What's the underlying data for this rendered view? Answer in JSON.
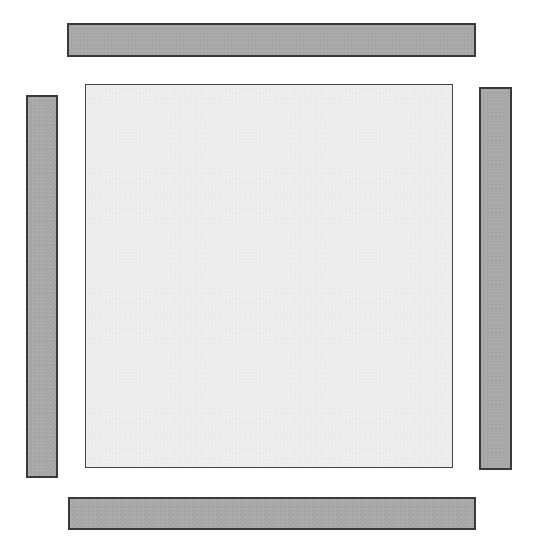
{
  "diagram": {
    "type": "layout",
    "colors": {
      "background": "#ffffff",
      "center_fill": "#ececec",
      "bar_fill": "#a9a9a9",
      "border": "#3a3a3a"
    },
    "elements": [
      {
        "id": "top-bar",
        "shape": "rectangle",
        "x": 67,
        "y": 23,
        "width": 409,
        "height": 34
      },
      {
        "id": "left-bar",
        "shape": "rectangle",
        "x": 26,
        "y": 95,
        "width": 32,
        "height": 383
      },
      {
        "id": "center-square",
        "shape": "rectangle",
        "x": 85,
        "y": 84,
        "width": 368,
        "height": 384
      },
      {
        "id": "right-bar",
        "shape": "rectangle",
        "x": 479,
        "y": 87,
        "width": 33,
        "height": 383
      },
      {
        "id": "bottom-bar",
        "shape": "rectangle",
        "x": 68,
        "y": 497,
        "width": 408,
        "height": 33
      }
    ]
  }
}
